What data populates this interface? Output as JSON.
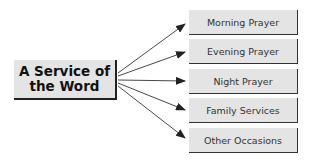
{
  "diagram": {
    "source": {
      "label": "A Service of the Word",
      "line1": "A Service of",
      "line2": "the Word"
    },
    "targets": [
      {
        "label": "Morning Prayer"
      },
      {
        "label": "Evening Prayer"
      },
      {
        "label": "Night Prayer"
      },
      {
        "label": "Family Services"
      },
      {
        "label": "Other Occasions"
      }
    ],
    "colors": {
      "box_fill": "#e4e4e4",
      "arrow": "#222222",
      "shadow": "#222222"
    }
  }
}
